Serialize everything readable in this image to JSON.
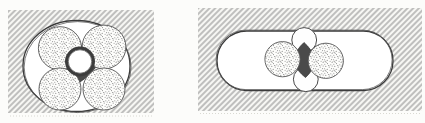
{
  "canvas": {
    "width": 425,
    "height": 123,
    "background": "#fcfcfa"
  },
  "style": {
    "hatch_line_color": "#747474",
    "hatch_bg_color": "#f7f7f4",
    "hatch_spacing": 4,
    "hatch_line_width": 0.85,
    "duct_outline_color": "#3a3a3a",
    "duct_outline_width": 1.3,
    "duct_fill": "#ffffff",
    "shadow_line_color": "#5a5a5a",
    "core_fill": "#fdfdfb",
    "core_outline_color": "#555555",
    "core_outline_width": 0.9,
    "stipple_dot_color": "#8f8f8f",
    "stipple_dark_dot_color": "#606060",
    "interstice_fill": "#4a4a4a",
    "interstice_edge_color": "#2e2e2e",
    "ring_fill": "#3c3c3c",
    "ring_inner_fill": "#ffffff",
    "ring_inner_outline": "#6a6a6a",
    "filler_fill": "#fefefe",
    "filler_outline": "#4a4a4a",
    "scan_dot_color": "#cfcfc8"
  },
  "panels": [
    {
      "name": "oval-duct-four-core-cable",
      "block": {
        "x": 8,
        "y": 10,
        "width": 146,
        "height": 103
      },
      "duct": {
        "shape": "ellipse",
        "cx": 76.5,
        "cy": 66,
        "rx": 53.5,
        "ry": 45.5,
        "shadow_dx": 1.1,
        "shadow_dy": 1.1
      },
      "interstice": {
        "points": [
          [
            79,
            44
          ],
          [
            99,
            62
          ],
          [
            80,
            82
          ],
          [
            59,
            62
          ]
        ],
        "bulge": 3.5
      },
      "cores": [
        {
          "cx": 60,
          "cy": 48.3,
          "r": 21.6
        },
        {
          "cx": 104,
          "cy": 47,
          "r": 21.9
        },
        {
          "cx": 60,
          "cy": 89,
          "r": 21
        },
        {
          "cx": 104,
          "cy": 89,
          "r": 21
        }
      ],
      "center_ring": {
        "cx": 80,
        "cy": 61.5,
        "outer_r": 15,
        "inner_r": 11.7
      },
      "scan_line": {
        "x1": 10,
        "x2": 152,
        "y": 116
      }
    },
    {
      "name": "flat-duct-two-core-cable",
      "block": {
        "x": 198,
        "y": 8,
        "width": 224,
        "height": 103
      },
      "duct": {
        "shape": "stadium",
        "x": 217,
        "y": 31,
        "width": 176,
        "height": 59.5,
        "shadow_dx": -0.9,
        "shadow_dy": -0.9
      },
      "fillers": [
        {
          "cx": 304.2,
          "cy": 40,
          "r": 12.4
        },
        {
          "cx": 305.8,
          "cy": 79.2,
          "r": 12.4
        }
      ],
      "interstice": {
        "points": [
          [
            304,
            42.5
          ],
          [
            316,
            60.5
          ],
          [
            305.5,
            77.5
          ],
          [
            292.5,
            60.5
          ]
        ],
        "bulge": 3
      },
      "cores": [
        {
          "cx": 282.5,
          "cy": 59.2,
          "r": 17.6
        },
        {
          "cx": 325.8,
          "cy": 60.8,
          "r": 17.6
        }
      ],
      "scan_line": {
        "x1": 200,
        "x2": 420,
        "y": 113.5
      }
    }
  ]
}
